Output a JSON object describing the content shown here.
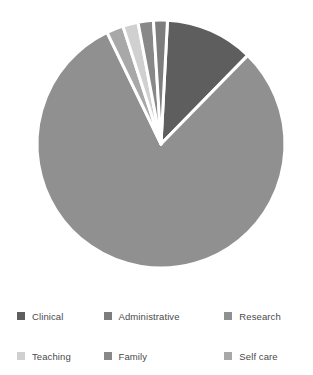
{
  "chart_data": {
    "type": "pie",
    "title": "",
    "subtitle": "",
    "xlabel": "",
    "ylabel": "",
    "legend_position": "bottom",
    "grid": false,
    "start_angle_deg": 3,
    "direction": "clockwise",
    "categories": [
      "Clinical",
      "Administrative",
      "Research",
      "Teaching",
      "Family",
      "Self care"
    ],
    "values": [
      11.5,
      80.5,
      2.2,
      2.0,
      2.0,
      1.8
    ],
    "units": "percent",
    "slices": [
      {
        "label": "Clinical",
        "value": 11.5,
        "color": "#5e5e5e",
        "start_deg": 3,
        "end_deg": 44.4
      },
      {
        "label": "Administrative",
        "value": 80.5,
        "color": "#909090",
        "start_deg": 44.4,
        "end_deg": 334.2
      },
      {
        "label": "Research",
        "value": 2.2,
        "color": "#a8a8a8",
        "start_deg": 334.2,
        "end_deg": 342.1
      },
      {
        "label": "Teaching",
        "value": 2.0,
        "color": "#d0d0d0",
        "start_deg": 342.1,
        "end_deg": 349.3
      },
      {
        "label": "Family",
        "value": 2.0,
        "color": "#888888",
        "start_deg": 349.3,
        "end_deg": 356.5
      },
      {
        "label": "Self care",
        "value": 1.8,
        "color": "#7d7d7d",
        "start_deg": 356.5,
        "end_deg": 363.0
      }
    ],
    "geometry": {
      "center_x": 161,
      "center_y": 144,
      "radius": 124,
      "separator_color": "#ffffff",
      "separator_width": 3
    }
  },
  "legend": {
    "rows": [
      [
        {
          "label": "Clinical",
          "color": "#5e5e5e"
        },
        {
          "label": "Administrative",
          "color": "#7d7d7d"
        },
        {
          "label": "Research",
          "color": "#909090"
        }
      ],
      [
        {
          "label": "Teaching",
          "color": "#d0d0d0"
        },
        {
          "label": "Family",
          "color": "#888888"
        },
        {
          "label": "Self care",
          "color": "#a8a8a8"
        }
      ]
    ]
  }
}
